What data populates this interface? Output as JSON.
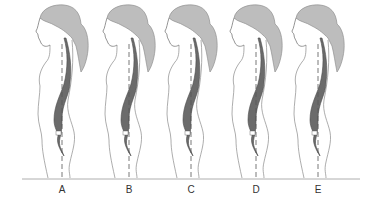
{
  "figure": {
    "colors": {
      "outline": "#8a8a8a",
      "hair": "#b9b9b9",
      "hair_shadow": "#9a9a9a",
      "spine": "#6b6b6b",
      "spine_dark": "#4a4a4a",
      "plumb_line": "#555555",
      "baseline": "#9a9a9a",
      "label": "#333333"
    },
    "figures": [
      {
        "label": "A",
        "x": 62
      },
      {
        "label": "B",
        "x": 129
      },
      {
        "label": "C",
        "x": 191
      },
      {
        "label": "D",
        "x": 256
      },
      {
        "label": "E",
        "x": 318
      }
    ]
  }
}
